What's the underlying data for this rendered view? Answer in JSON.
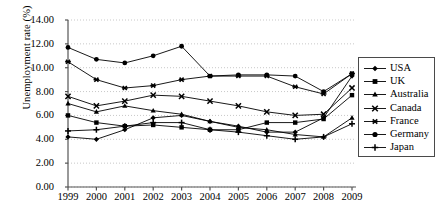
{
  "chart_data": {
    "type": "line",
    "title": "",
    "xlabel": "",
    "ylabel": "Unemployment rate (%)",
    "categories": [
      "1999",
      "2000",
      "2001",
      "2002",
      "2003",
      "2004",
      "2005",
      "2006",
      "2007",
      "2008",
      "2009"
    ],
    "x": [
      1999,
      2000,
      2001,
      2002,
      2003,
      2004,
      2005,
      2006,
      2007,
      2008,
      2009
    ],
    "ylim": [
      0.0,
      14.0
    ],
    "ytick_values": [
      0.0,
      2.0,
      4.0,
      6.0,
      8.0,
      10.0,
      12.0,
      14.0
    ],
    "ytick_labels": [
      "0.00",
      "2.00",
      "4.00",
      "6.00",
      "8.00",
      "10.00",
      "12.00",
      "14.00"
    ],
    "grid": "horizontal-dotted",
    "legend_position": "right",
    "series": [
      {
        "name": "USA",
        "marker": "diamond",
        "values": [
          4.2,
          4.0,
          4.8,
          5.8,
          6.0,
          5.5,
          5.1,
          4.6,
          4.6,
          5.8,
          9.3
        ]
      },
      {
        "name": "UK",
        "marker": "square",
        "values": [
          6.0,
          5.4,
          5.1,
          5.2,
          5.0,
          4.8,
          4.8,
          5.4,
          5.4,
          5.7,
          7.7
        ]
      },
      {
        "name": "Australia",
        "marker": "triangle",
        "values": [
          7.0,
          6.3,
          6.8,
          6.4,
          6.1,
          5.5,
          5.0,
          4.8,
          4.4,
          4.2,
          5.8
        ]
      },
      {
        "name": "Canada",
        "marker": "cross",
        "values": [
          7.6,
          6.8,
          7.2,
          7.7,
          7.6,
          7.2,
          6.8,
          6.3,
          6.0,
          6.1,
          8.3
        ]
      },
      {
        "name": "France",
        "marker": "asterisk",
        "values": [
          10.5,
          9.0,
          8.3,
          8.5,
          9.0,
          9.3,
          9.3,
          9.3,
          8.4,
          7.8,
          9.5
        ]
      },
      {
        "name": "Germany",
        "marker": "circle",
        "values": [
          11.7,
          10.7,
          10.4,
          11.0,
          11.8,
          9.3,
          9.4,
          9.4,
          9.3,
          8.0,
          9.5
        ]
      },
      {
        "name": "Japan",
        "marker": "plus",
        "values": [
          4.7,
          4.8,
          5.1,
          5.4,
          5.4,
          4.8,
          4.6,
          4.3,
          4.0,
          4.2,
          5.3
        ]
      }
    ]
  },
  "legend": {
    "items": [
      {
        "label": "USA",
        "marker": "diamond"
      },
      {
        "label": "UK",
        "marker": "square"
      },
      {
        "label": "Australia",
        "marker": "triangle"
      },
      {
        "label": "Canada",
        "marker": "cross"
      },
      {
        "label": "France",
        "marker": "asterisk"
      },
      {
        "label": "Germany",
        "marker": "circle"
      },
      {
        "label": "Japan",
        "marker": "plus"
      }
    ]
  },
  "colors": {
    "series": "#000000",
    "grid": "#c8c8c8",
    "axis": "#555555",
    "background": "#ffffff"
  }
}
